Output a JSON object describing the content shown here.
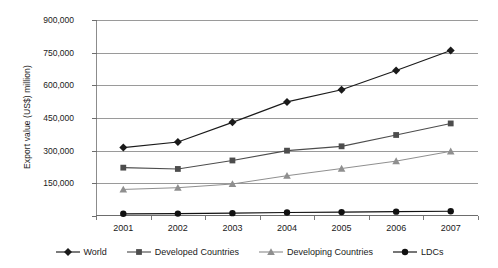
{
  "chart_data": {
    "type": "line",
    "title": "",
    "xlabel": "",
    "ylabel": "Export value (US$) million)",
    "categories": [
      "2001",
      "2002",
      "2003",
      "2004",
      "2005",
      "2006",
      "2007"
    ],
    "x": [
      2001,
      2002,
      2003,
      2004,
      2005,
      2006,
      2007
    ],
    "ylim": [
      0,
      900000
    ],
    "yticks": [
      0,
      150000,
      300000,
      450000,
      600000,
      750000,
      900000
    ],
    "ytick_labels": [
      "",
      "150,000",
      "300,000",
      "450,000",
      "600,000",
      "750,000",
      "900,000"
    ],
    "grid": true,
    "legend_position": "bottom",
    "series": [
      {
        "name": "World",
        "marker": "diamond",
        "color": "#1a1a1a",
        "values": [
          314000,
          340000,
          430000,
          524000,
          580000,
          668000,
          760000
        ]
      },
      {
        "name": "Developed Countries",
        "marker": "square",
        "color": "#4d4d4d",
        "values": [
          222000,
          216000,
          255000,
          300000,
          320000,
          372000,
          425000
        ]
      },
      {
        "name": "Developing Countries",
        "marker": "triangle",
        "color": "#8f8f8f",
        "values": [
          122000,
          130000,
          147000,
          185000,
          218000,
          252000,
          297000
        ]
      },
      {
        "name": "LDCs",
        "marker": "circle",
        "color": "#111111",
        "values": [
          10000,
          11000,
          13000,
          16000,
          18000,
          20000,
          22000
        ]
      }
    ]
  },
  "legend": {
    "items": [
      {
        "label": "World"
      },
      {
        "label": "Developed Countries"
      },
      {
        "label": "Developing Countries"
      },
      {
        "label": "LDCs"
      }
    ]
  }
}
